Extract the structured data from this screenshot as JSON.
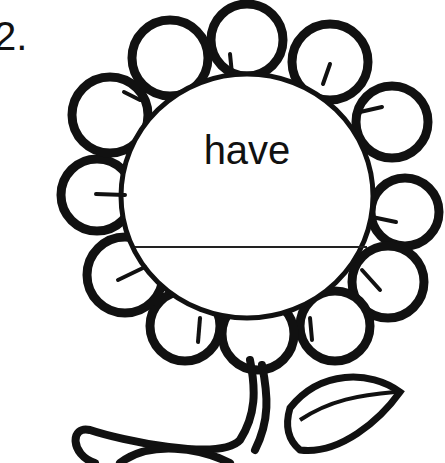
{
  "worksheet": {
    "item_number": "2.",
    "word": "have",
    "answer_value": ""
  },
  "illustration": {
    "subject": "flower-icon",
    "petal_count": 12,
    "ink_color": "#111111",
    "paper_color": "#ffffff"
  }
}
